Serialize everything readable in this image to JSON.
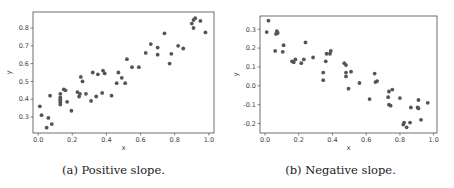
{
  "chart_data": [
    {
      "type": "scatter",
      "title": "",
      "caption": "(a) Positive slope.",
      "xlabel": "x",
      "ylabel": "y",
      "xlim": [
        -0.03,
        1.03
      ],
      "ylim": [
        0.21,
        0.89
      ],
      "xticks": [
        "0.0",
        "0.2",
        "0.4",
        "0.6",
        "0.8",
        "1.0"
      ],
      "yticks": [
        "0.3",
        "0.4",
        "0.5",
        "0.6",
        "0.7",
        "0.8"
      ],
      "grid": false,
      "marker_color": "#555555",
      "points": [
        [
          0.01,
          0.36
        ],
        [
          0.02,
          0.31
        ],
        [
          0.06,
          0.295
        ],
        [
          0.05,
          0.24
        ],
        [
          0.08,
          0.26
        ],
        [
          0.07,
          0.42
        ],
        [
          0.13,
          0.43
        ],
        [
          0.13,
          0.41
        ],
        [
          0.13,
          0.4
        ],
        [
          0.13,
          0.39
        ],
        [
          0.13,
          0.38
        ],
        [
          0.13,
          0.37
        ],
        [
          0.15,
          0.455
        ],
        [
          0.16,
          0.45
        ],
        [
          0.17,
          0.385
        ],
        [
          0.195,
          0.335
        ],
        [
          0.23,
          0.44
        ],
        [
          0.24,
          0.415
        ],
        [
          0.245,
          0.43
        ],
        [
          0.25,
          0.525
        ],
        [
          0.26,
          0.5
        ],
        [
          0.28,
          0.43
        ],
        [
          0.31,
          0.39
        ],
        [
          0.32,
          0.55
        ],
        [
          0.34,
          0.415
        ],
        [
          0.35,
          0.54
        ],
        [
          0.375,
          0.435
        ],
        [
          0.38,
          0.56
        ],
        [
          0.39,
          0.545
        ],
        [
          0.43,
          0.42
        ],
        [
          0.46,
          0.49
        ],
        [
          0.47,
          0.55
        ],
        [
          0.49,
          0.52
        ],
        [
          0.51,
          0.49
        ],
        [
          0.52,
          0.625
        ],
        [
          0.55,
          0.58
        ],
        [
          0.59,
          0.58
        ],
        [
          0.63,
          0.66
        ],
        [
          0.66,
          0.71
        ],
        [
          0.7,
          0.69
        ],
        [
          0.7,
          0.65
        ],
        [
          0.74,
          0.77
        ],
        [
          0.77,
          0.6
        ],
        [
          0.78,
          0.655
        ],
        [
          0.82,
          0.7
        ],
        [
          0.85,
          0.685
        ],
        [
          0.9,
          0.825
        ],
        [
          0.91,
          0.845
        ],
        [
          0.92,
          0.855
        ],
        [
          0.91,
          0.8
        ],
        [
          0.95,
          0.84
        ],
        [
          0.98,
          0.775
        ]
      ]
    },
    {
      "type": "scatter",
      "title": "",
      "caption": "(b) Negative slope.",
      "xlabel": "x",
      "ylabel": "y",
      "xlim": [
        -0.03,
        1.02
      ],
      "ylim": [
        -0.25,
        0.37
      ],
      "xticks": [
        "0.0",
        "0.2",
        "0.4",
        "0.6",
        "0.8",
        "1.0"
      ],
      "yticks": [
        "-0.2",
        "-0.1",
        "0.0",
        "0.1",
        "0.2",
        "0.3"
      ],
      "grid": false,
      "marker_color": "#555555",
      "points": [
        [
          0.01,
          0.285
        ],
        [
          0.02,
          0.345
        ],
        [
          0.06,
          0.185
        ],
        [
          0.065,
          0.275
        ],
        [
          0.07,
          0.29
        ],
        [
          0.075,
          0.28
        ],
        [
          0.105,
          0.18
        ],
        [
          0.11,
          0.215
        ],
        [
          0.16,
          0.13
        ],
        [
          0.17,
          0.125
        ],
        [
          0.18,
          0.14
        ],
        [
          0.215,
          0.12
        ],
        [
          0.23,
          0.14
        ],
        [
          0.24,
          0.23
        ],
        [
          0.285,
          0.15
        ],
        [
          0.345,
          0.07
        ],
        [
          0.345,
          0.03
        ],
        [
          0.36,
          0.13
        ],
        [
          0.365,
          0.17
        ],
        [
          0.385,
          0.17
        ],
        [
          0.39,
          0.185
        ],
        [
          0.47,
          0.12
        ],
        [
          0.48,
          0.11
        ],
        [
          0.48,
          0.07
        ],
        [
          0.48,
          0.05
        ],
        [
          0.495,
          -0.015
        ],
        [
          0.51,
          0.075
        ],
        [
          0.56,
          0.015
        ],
        [
          0.62,
          -0.07
        ],
        [
          0.65,
          0.065
        ],
        [
          0.655,
          0.02
        ],
        [
          0.665,
          0.025
        ],
        [
          0.73,
          -0.06
        ],
        [
          0.735,
          -0.03
        ],
        [
          0.735,
          -0.1
        ],
        [
          0.745,
          -0.105
        ],
        [
          0.755,
          -0.02
        ],
        [
          0.8,
          -0.065
        ],
        [
          0.82,
          -0.205
        ],
        [
          0.825,
          -0.195
        ],
        [
          0.84,
          -0.22
        ],
        [
          0.86,
          -0.195
        ],
        [
          0.865,
          -0.115
        ],
        [
          0.905,
          -0.115
        ],
        [
          0.91,
          -0.075
        ],
        [
          0.91,
          -0.12
        ],
        [
          0.925,
          -0.18
        ],
        [
          0.965,
          -0.09
        ]
      ]
    }
  ]
}
